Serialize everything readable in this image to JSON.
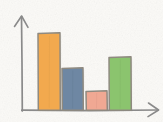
{
  "figure": {
    "title": "",
    "style": "hand-drawn sketch",
    "background_color": "#fbfaf7",
    "axis_color": "#8a8a8a",
    "width": 163,
    "height": 122
  },
  "axes": {
    "y_axis": {
      "name": "y-axis",
      "arrow": "up",
      "x": 22,
      "top_y": 16,
      "bottom_y": 111,
      "label": ""
    },
    "x_axis": {
      "name": "x-axis",
      "arrow": "right",
      "y": 110,
      "left_x": 22,
      "right_x": 158,
      "label": ""
    }
  },
  "chart_data": {
    "type": "bar",
    "title": "",
    "xlabel": "",
    "ylabel": "",
    "categories": [
      "1",
      "2",
      "3",
      "4"
    ],
    "values": [
      77,
      42,
      19,
      53
    ],
    "ylim": [
      0,
      94
    ],
    "grid": false,
    "legend": null,
    "tick_labels": {
      "x": [],
      "y": []
    },
    "series": [
      {
        "name": "values",
        "values": [
          77,
          42,
          19,
          53
        ]
      }
    ],
    "bars": [
      {
        "name": "bar-1-orange",
        "category": "1",
        "value": 77,
        "fill": "#f2a94e",
        "stroke": "#8f8a80",
        "x": 38,
        "width": 22,
        "top_y": 33,
        "base_y": 110
      },
      {
        "name": "bar-2-blue",
        "category": "2",
        "value": 42,
        "fill": "#6e87a3",
        "stroke": "#8f8a80",
        "x": 62,
        "width": 21,
        "top_y": 68,
        "base_y": 110
      },
      {
        "name": "bar-3-salmon",
        "category": "3",
        "value": 19,
        "fill": "#f0a893",
        "stroke": "#8f8a80",
        "x": 86,
        "width": 21,
        "top_y": 91,
        "base_y": 110
      },
      {
        "name": "bar-4-green",
        "category": "4",
        "value": 53,
        "fill": "#8bc46e",
        "stroke": "#8f8a80",
        "x": 109,
        "width": 22,
        "top_y": 57,
        "base_y": 110
      }
    ]
  }
}
